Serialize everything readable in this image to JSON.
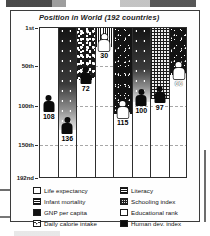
{
  "chart_data": {
    "type": "bar",
    "title": "Position in World (192 countries)",
    "subtitle": "",
    "xlabel": "",
    "ylabel": "",
    "ylim": [
      1,
      192
    ],
    "y_inverted": true,
    "grid": true,
    "legend_position": "bottom",
    "y_ticks": [
      {
        "value": 1,
        "label": "1st"
      },
      {
        "value": 50,
        "label": "50th"
      },
      {
        "value": 100,
        "label": "100th"
      },
      {
        "value": 150,
        "label": "150th"
      },
      {
        "value": 192,
        "label": "192nd"
      }
    ],
    "categories": [
      "Life expectancy",
      "Infant mortality",
      "GNP per capita",
      "Daily calorie intake",
      "Literacy",
      "Schooling index",
      "Educational rank",
      "Human dev. index"
    ],
    "values": [
      108,
      136,
      72,
      30,
      115,
      100,
      97,
      66
    ],
    "value_labels": [
      "108",
      "136",
      "72",
      "30",
      "115",
      "100",
      "97",
      "66"
    ],
    "columns": [
      {
        "label": "Life expectancy",
        "value": 108,
        "value_text": "108",
        "texture": "tex-white",
        "marker": "dark",
        "label_on_dark": false
      },
      {
        "label": "Infant mortality",
        "value": 136,
        "value_text": "136",
        "texture": "tex-grad",
        "marker": "dark",
        "label_on_dark": false
      },
      {
        "label": "GNP per capita",
        "value": 72,
        "value_text": "72",
        "texture": "tex-speckle",
        "marker": "dark",
        "label_on_dark": false
      },
      {
        "label": "Daily calorie intake",
        "value": 30,
        "value_text": "30",
        "texture": "tex-vstripe",
        "marker": "light",
        "label_on_dark": false
      },
      {
        "label": "Literacy",
        "value": 115,
        "value_text": "115",
        "texture": "tex-dark",
        "marker": "light",
        "label_on_dark": false
      },
      {
        "label": "Schooling index",
        "value": 100,
        "value_text": "100",
        "texture": "tex-grad",
        "marker": "dark",
        "label_on_dark": false
      },
      {
        "label": "Educational rank",
        "value": 97,
        "value_text": "97",
        "texture": "tex-grid",
        "marker": "dark",
        "label_on_dark": false
      },
      {
        "label": "Human dev. index",
        "value": 66,
        "value_text": "66",
        "texture": "tex-dark",
        "marker": "light",
        "label_on_dark": true
      }
    ]
  },
  "legend": {
    "left": [
      {
        "label": "Life expectancy",
        "swatch": "sw-white",
        "icon": "legend-swatch-white"
      },
      {
        "label": "Infant mortality",
        "swatch": "sw-hstripe",
        "icon": "legend-swatch-striped"
      },
      {
        "label": "GNP per capita",
        "swatch": "sw-dark",
        "icon": "legend-swatch-dark"
      },
      {
        "label": "Daily calorie intake",
        "swatch": "sw-dots",
        "icon": "legend-swatch-dotted"
      }
    ],
    "right": [
      {
        "label": "Literacy",
        "swatch": "sw-hstripe",
        "icon": "legend-swatch-striped"
      },
      {
        "label": "Schooling index",
        "swatch": "sw-grid",
        "icon": "legend-swatch-grid"
      },
      {
        "label": "Educational rank",
        "swatch": "sw-white",
        "icon": "legend-swatch-outline"
      },
      {
        "label": "Human dev. index",
        "swatch": "sw-solid",
        "icon": "legend-swatch-solid"
      }
    ]
  },
  "colors": {
    "ink": "#141414",
    "paper": "#ffffff",
    "grid": "#9a9a9a",
    "axis": "#2e2e2e"
  }
}
